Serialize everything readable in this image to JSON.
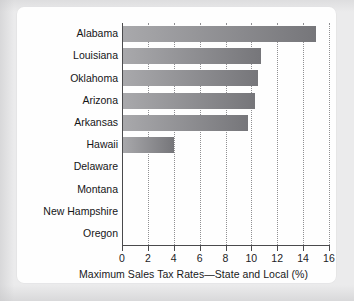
{
  "chart_data": {
    "type": "bar",
    "orientation": "horizontal",
    "title": "",
    "xlabel": "Maximum Sales Tax Rates—State and Local (%)",
    "ylabel": "",
    "xlim": [
      0,
      16
    ],
    "xticks": [
      0,
      2,
      4,
      6,
      8,
      10,
      12,
      14,
      16
    ],
    "xtick_labels": [
      "0",
      "2",
      "4",
      "6",
      "8",
      "10",
      "12",
      "14",
      "16"
    ],
    "grid": "vertical-dotted",
    "legend": "none",
    "categories": [
      "Alabama",
      "Louisiana",
      "Oklahoma",
      "Arizona",
      "Arkansas",
      "Hawaii",
      "Delaware",
      "Montana",
      "New Hampshire",
      "Oregon"
    ],
    "values": [
      15.0,
      10.75,
      10.5,
      10.25,
      9.75,
      4.0,
      0,
      0,
      0,
      0
    ],
    "bar_color_left": "#a9a9ac",
    "bar_color_right": "#76767a"
  },
  "figure": {
    "panel_background": "#fefefe",
    "page_background": "#ebebec",
    "axis_color": "#4a4a4c",
    "grid_color": "#8f8f92",
    "text_color": "#18181a"
  }
}
